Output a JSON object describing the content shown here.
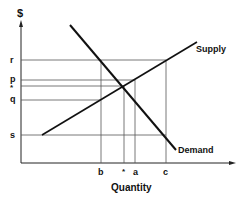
{
  "diagram": {
    "y_axis_label": "$",
    "x_axis_label": "Quantity",
    "y_ticks": [
      "r",
      "p",
      "*",
      "q",
      "s"
    ],
    "x_ticks": [
      "b",
      "*",
      "a",
      "c"
    ],
    "curves": [
      {
        "name": "Supply",
        "label": "Supply"
      },
      {
        "name": "Demand",
        "label": "Demand"
      }
    ],
    "colors": {
      "line": "#111111",
      "guide": "#555555"
    }
  }
}
